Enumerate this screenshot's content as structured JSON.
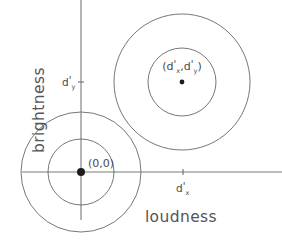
{
  "figure": {
    "background_color": "#ffffff",
    "line_color": "#5e5e5e",
    "axis_color": "#7a7a7a",
    "text_color": "#4a4a4a"
  },
  "axes": {
    "x": {
      "label": "loudness",
      "tick_label_main": "d",
      "tick_label_prime": "'",
      "tick_label_sub": "x",
      "tick_value_x": 183,
      "line_y": 172,
      "line_x_start": 22,
      "line_x_end": 282
    },
    "y": {
      "label": "brightness",
      "tick_label_main": "d",
      "tick_label_prime": "'",
      "tick_label_sub": "y",
      "tick_value_y": 82,
      "line_x": 81,
      "line_y_start": 0,
      "line_y_end": 220
    }
  },
  "distributions": [
    {
      "name": "noise-distribution",
      "label_text": "(0,0)",
      "center": {
        "x": 81,
        "y": 172
      },
      "inner_radius": 33,
      "outer_radius": 60,
      "label_offset": {
        "x": 6,
        "y": -6
      }
    },
    {
      "name": "signal-distribution",
      "label_open": "(",
      "label_d1": "d",
      "label_prime1": "'",
      "label_sub1": "x",
      "label_comma": ",",
      "label_d2": "d",
      "label_prime2": "'",
      "label_sub2": "y",
      "label_close": ")",
      "center": {
        "x": 182,
        "y": 82
      },
      "inner_radius": 34,
      "outer_radius": 68,
      "label_offset": {
        "x": 0,
        "y": -14
      }
    }
  ]
}
